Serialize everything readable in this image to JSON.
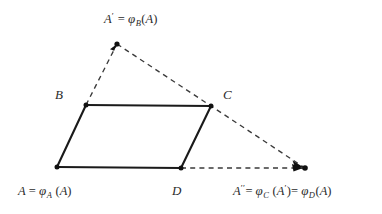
{
  "diagram": {
    "background_color": "#ffffff",
    "solid_line_color": "#1a1a1a",
    "dashed_line_color": "#3a3a3a",
    "point_color": "#111111",
    "labels": {
      "a_prime": {
        "full_text": "A' = φ B(A)",
        "lead": "A",
        "prime": "′",
        "equals": "=",
        "phi": "φ",
        "subscript": "B",
        "arg_open": "(",
        "arg": "A",
        "arg_close": ")"
      },
      "b": {
        "text": "B"
      },
      "c": {
        "text": "C"
      },
      "d": {
        "text": "D"
      },
      "a": {
        "full_text": "A = φ A (A)",
        "lead": "A",
        "equals": "=",
        "phi": "φ",
        "subscript": "A",
        "arg_open": "(",
        "arg": "A",
        "arg_close": ")"
      },
      "a_double_prime": {
        "full_text": "A″ = φ C (A') = φ D(A)",
        "lead": "A",
        "dprime": "′′",
        "equals1": "=",
        "phi1": "φ",
        "subscript1": "C",
        "arg1_open": "(",
        "arg1": "A",
        "arg1_prime": "′",
        "arg1_close": ")",
        "equals2": "=",
        "phi2": "φ",
        "subscript2": "D",
        "arg2_open": "(",
        "arg2": "A",
        "arg2_close": ")"
      }
    },
    "points": {
      "A": {
        "x": 57,
        "y": 167
      },
      "B": {
        "x": 86,
        "y": 105
      },
      "C": {
        "x": 211,
        "y": 106
      },
      "D": {
        "x": 181,
        "y": 168
      },
      "A_prime": {
        "x": 117,
        "y": 44
      },
      "A_dprime": {
        "x": 305,
        "y": 168
      }
    },
    "solid_edges": [
      {
        "name": "edge-A-B",
        "from": "A",
        "to": "B"
      },
      {
        "name": "edge-B-C",
        "from": "B",
        "to": "C"
      },
      {
        "name": "edge-C-D",
        "from": "C",
        "to": "D"
      },
      {
        "name": "edge-D-A",
        "from": "D",
        "to": "A"
      }
    ],
    "dashed_edges": [
      {
        "name": "dashed-B-to-Aprime",
        "from": "B",
        "to": "A_prime",
        "arrow_at_end": true
      },
      {
        "name": "dashed-Aprime-to-Adprime",
        "from": "A_prime",
        "to": "A_dprime",
        "arrow_at_end": true
      },
      {
        "name": "dashed-D-to-Adprime",
        "from": "D",
        "to": "A_dprime",
        "arrow_at_end": true
      }
    ],
    "dot_markers": [
      "A",
      "B",
      "C",
      "D",
      "A_prime",
      "A_dprime"
    ]
  }
}
